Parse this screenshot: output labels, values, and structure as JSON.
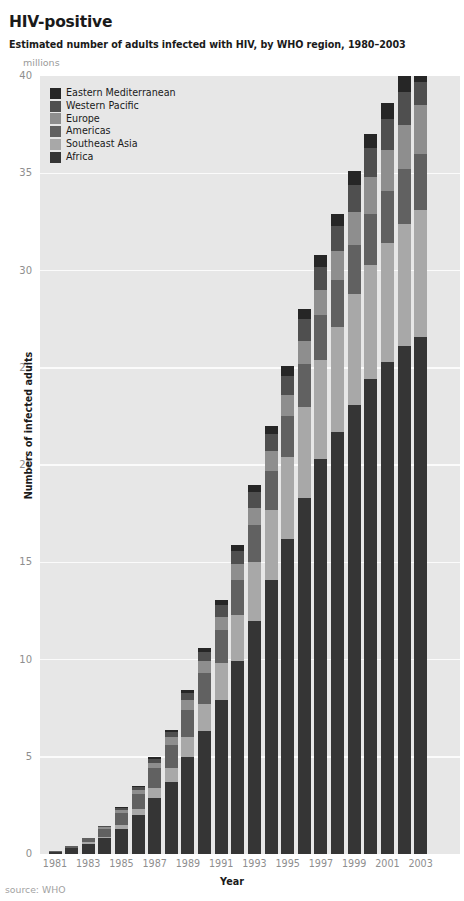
{
  "header": {
    "title": "HIV-positive",
    "subtitle": "Estimated number of adults infected with HIV, by WHO region, 1980–2003",
    "units_label": "millions"
  },
  "source_note": "source: WHO",
  "axes": {
    "x_title": "Year",
    "y_title": "Numbers of infected adults",
    "y_ticks": [
      "0",
      "5",
      "10",
      "15",
      "20",
      "25",
      "30",
      "35",
      "40"
    ],
    "x_ticks": [
      "1981",
      "1983",
      "1985",
      "1987",
      "1989",
      "1991",
      "1993",
      "1995",
      "1997",
      "1999",
      "2001",
      "2003"
    ]
  },
  "colors": {
    "plot_background": "#e7e7e7",
    "gridline": "#fbfbfb",
    "page_background": "#ffffff",
    "tick_text": "#8e8e8e",
    "title_text": "#1a1a1a",
    "series": {
      "Eastern Mediterranean": "#262626",
      "Western Pacific": "#4f4f4f",
      "Europe": "#8e8e8e",
      "Americas": "#616161",
      "Southeast Asia": "#a8a8a8",
      "Africa": "#353535"
    }
  },
  "legend": {
    "position": "top-left-inside",
    "entries": [
      {
        "label": "Eastern Mediterranean",
        "color": "#262626"
      },
      {
        "label": "Western Pacific",
        "color": "#4f4f4f"
      },
      {
        "label": "Europe",
        "color": "#8e8e8e"
      },
      {
        "label": "Americas",
        "color": "#616161"
      },
      {
        "label": "Southeast Asia",
        "color": "#a8a8a8"
      },
      {
        "label": "Africa",
        "color": "#353535"
      }
    ]
  },
  "chart_data": {
    "type": "bar",
    "subtype": "stacked-vertical",
    "title": "HIV-positive",
    "subtitle": "Estimated number of adults infected with HIV, by WHO region, 1980–2003",
    "xlabel": "Year",
    "ylabel": "Numbers of infected adults",
    "units": "millions",
    "ylim": [
      0,
      40
    ],
    "ytick_step": 5,
    "grid": true,
    "grid_axis": "y",
    "legend_order_top_to_bottom": [
      "Eastern Mediterranean",
      "Western Pacific",
      "Europe",
      "Americas",
      "Southeast Asia",
      "Africa"
    ],
    "stack_order_bottom_to_top": [
      "Africa",
      "Southeast Asia",
      "Americas",
      "Europe",
      "Western Pacific",
      "Eastern Mediterranean"
    ],
    "categories": [
      1981,
      1982,
      1983,
      1984,
      1985,
      1986,
      1987,
      1988,
      1989,
      1990,
      1991,
      1992,
      1993,
      1994,
      1995,
      1996,
      1997,
      1998,
      1999,
      2000,
      2001,
      2002,
      2003
    ],
    "series": [
      {
        "name": "Africa",
        "color": "#353535",
        "values": [
          0.1,
          0.3,
          0.5,
          0.8,
          1.3,
          2.0,
          2.9,
          3.7,
          5.0,
          6.3,
          7.9,
          9.9,
          12.0,
          14.1,
          16.2,
          18.3,
          20.3,
          21.7,
          23.1,
          24.4,
          25.3,
          26.1,
          26.6
        ]
      },
      {
        "name": "Southeast Asia",
        "color": "#a8a8a8",
        "values": [
          0.0,
          0.0,
          0.1,
          0.1,
          0.2,
          0.3,
          0.5,
          0.7,
          1.0,
          1.4,
          1.9,
          2.4,
          3.0,
          3.6,
          4.2,
          4.7,
          5.1,
          5.4,
          5.7,
          5.9,
          6.1,
          6.3,
          6.5
        ]
      },
      {
        "name": "Americas",
        "color": "#616161",
        "values": [
          0.05,
          0.1,
          0.2,
          0.4,
          0.6,
          0.8,
          1.0,
          1.2,
          1.4,
          1.6,
          1.7,
          1.8,
          1.9,
          2.0,
          2.1,
          2.2,
          2.3,
          2.4,
          2.5,
          2.6,
          2.7,
          2.8,
          2.9
        ]
      },
      {
        "name": "Europe",
        "color": "#8e8e8e",
        "values": [
          0.0,
          0.0,
          0.05,
          0.1,
          0.15,
          0.2,
          0.3,
          0.4,
          0.5,
          0.6,
          0.7,
          0.8,
          0.9,
          1.0,
          1.1,
          1.2,
          1.3,
          1.5,
          1.7,
          1.9,
          2.1,
          2.3,
          2.5
        ]
      },
      {
        "name": "Western Pacific",
        "color": "#4f4f4f",
        "values": [
          0.0,
          0.0,
          0.0,
          0.05,
          0.1,
          0.15,
          0.2,
          0.3,
          0.4,
          0.5,
          0.6,
          0.7,
          0.8,
          0.9,
          1.0,
          1.1,
          1.2,
          1.3,
          1.4,
          1.5,
          1.6,
          1.7,
          1.2
        ]
      },
      {
        "name": "Eastern Mediterranean",
        "color": "#262626",
        "values": [
          0.0,
          0.0,
          0.0,
          0.0,
          0.05,
          0.05,
          0.1,
          0.1,
          0.15,
          0.2,
          0.25,
          0.3,
          0.4,
          0.4,
          0.5,
          0.5,
          0.6,
          0.6,
          0.7,
          0.7,
          0.8,
          0.8,
          0.9
        ]
      }
    ],
    "totals": [
      0.15,
      0.4,
      0.85,
      1.45,
      2.4,
      3.5,
      5.0,
      6.4,
      8.45,
      10.6,
      13.05,
      15.9,
      19.0,
      22.0,
      25.1,
      28.0,
      30.8,
      32.9,
      35.1,
      37.0,
      38.6,
      40.0,
      40.5
    ]
  }
}
